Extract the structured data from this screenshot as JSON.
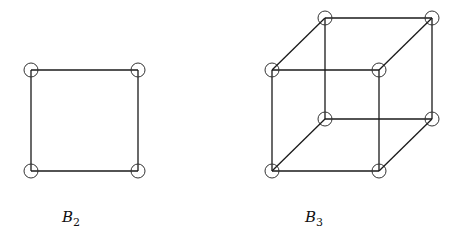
{
  "figures": [
    {
      "name": "B2",
      "label": "B",
      "subscript": "2",
      "label_pos": [
        62,
        208
      ],
      "vertices": [
        [
          31,
          70
        ],
        [
          138,
          70
        ],
        [
          31,
          171
        ],
        [
          138,
          171
        ]
      ],
      "edges": [
        [
          0,
          1
        ],
        [
          1,
          3
        ],
        [
          3,
          2
        ],
        [
          2,
          0
        ]
      ]
    },
    {
      "name": "B3",
      "label": "B",
      "subscript": "3",
      "label_pos": [
        305,
        208
      ],
      "vertices": [
        [
          325,
          18
        ],
        [
          432,
          18
        ],
        [
          325,
          119
        ],
        [
          432,
          119
        ],
        [
          272,
          70
        ],
        [
          379,
          70
        ],
        [
          272,
          171
        ],
        [
          379,
          171
        ]
      ],
      "edges": [
        [
          0,
          1
        ],
        [
          1,
          3
        ],
        [
          3,
          2
        ],
        [
          2,
          0
        ],
        [
          4,
          5
        ],
        [
          5,
          7
        ],
        [
          7,
          6
        ],
        [
          6,
          4
        ],
        [
          0,
          4
        ],
        [
          1,
          5
        ],
        [
          2,
          6
        ],
        [
          3,
          7
        ]
      ]
    }
  ],
  "style": {
    "node_radius": 7,
    "edge_color": "#1a1a1a",
    "node_color": "#333333"
  }
}
